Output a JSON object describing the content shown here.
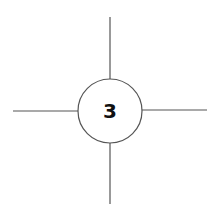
{
  "diagram": {
    "node": {
      "label": "3",
      "cx": 110,
      "cy": 111,
      "r": 32
    },
    "colors": {
      "stroke": "#555555",
      "text": "#111111",
      "background": "#ffffff"
    },
    "edges": [
      {
        "name": "up",
        "x1": 110,
        "y1": 17,
        "x2": 110,
        "y2": 79
      },
      {
        "name": "down",
        "x1": 110,
        "y1": 143,
        "x2": 110,
        "y2": 204
      },
      {
        "name": "left",
        "x1": 13,
        "y1": 111,
        "x2": 78,
        "y2": 111
      },
      {
        "name": "right",
        "x1": 142,
        "y1": 110,
        "x2": 207,
        "y2": 110
      }
    ]
  }
}
